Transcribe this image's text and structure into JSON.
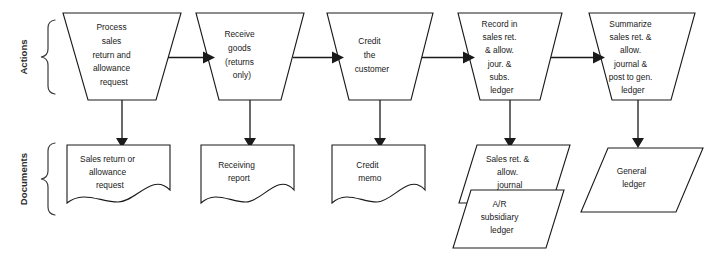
{
  "diagram": {
    "background_color": "#ffffff",
    "line_color": "#1a1a1a",
    "rows": [
      {
        "id": "actions",
        "label": "Actions"
      },
      {
        "id": "documents",
        "label": "Documents"
      }
    ],
    "actions": [
      {
        "id": "action-1",
        "shape": "trapezoid",
        "lines": [
          "Process",
          "sales",
          "return and",
          "allowance",
          "request"
        ]
      },
      {
        "id": "action-2",
        "shape": "trapezoid",
        "lines": [
          "Receive",
          "goods",
          "(returns",
          "only)"
        ]
      },
      {
        "id": "action-3",
        "shape": "trapezoid",
        "lines": [
          "Credit",
          "the",
          "customer"
        ]
      },
      {
        "id": "action-4",
        "shape": "trapezoid",
        "lines": [
          "Record in",
          "sales ret.",
          "& allow.",
          "jour. &",
          "subs.",
          "ledger"
        ]
      },
      {
        "id": "action-5",
        "shape": "trapezoid",
        "lines": [
          "Summarize",
          "sales ret. &",
          "allow.",
          "journal &",
          "post to gen.",
          "ledger"
        ]
      }
    ],
    "documents": [
      {
        "id": "doc-1",
        "shape": "document",
        "lines": [
          "Sales return or",
          "allowance",
          "request"
        ]
      },
      {
        "id": "doc-2",
        "shape": "document",
        "lines": [
          "Receiving",
          "report"
        ]
      },
      {
        "id": "doc-3",
        "shape": "document",
        "lines": [
          "Credit",
          "memo"
        ]
      },
      {
        "id": "doc-4",
        "shape": "parallelogram",
        "lines": [
          "Sales ret. &",
          "allow.",
          "journal"
        ]
      },
      {
        "id": "doc-5",
        "shape": "parallelogram",
        "lines": [
          "A/R",
          "subsidiary",
          "ledger"
        ]
      },
      {
        "id": "doc-6",
        "shape": "parallelogram",
        "lines": [
          "General",
          "ledger"
        ]
      }
    ],
    "connectors": [
      {
        "id": "flow-1-2",
        "from": "action-1",
        "to": "action-2",
        "direction": "horizontal"
      },
      {
        "id": "flow-2-3",
        "from": "action-2",
        "to": "action-3",
        "direction": "horizontal"
      },
      {
        "id": "flow-3-4",
        "from": "action-3",
        "to": "action-4",
        "direction": "horizontal"
      },
      {
        "id": "flow-4-5",
        "from": "action-4",
        "to": "action-5",
        "direction": "horizontal"
      },
      {
        "id": "flow-a1-d1",
        "from": "action-1",
        "to": "doc-1",
        "direction": "vertical"
      },
      {
        "id": "flow-a2-d2",
        "from": "action-2",
        "to": "doc-2",
        "direction": "vertical"
      },
      {
        "id": "flow-a3-d3",
        "from": "action-3",
        "to": "doc-3",
        "direction": "vertical"
      },
      {
        "id": "flow-a4-d4",
        "from": "action-4",
        "to": "doc-4",
        "direction": "vertical"
      },
      {
        "id": "flow-a5-d6",
        "from": "action-5",
        "to": "doc-6",
        "direction": "vertical"
      }
    ]
  }
}
